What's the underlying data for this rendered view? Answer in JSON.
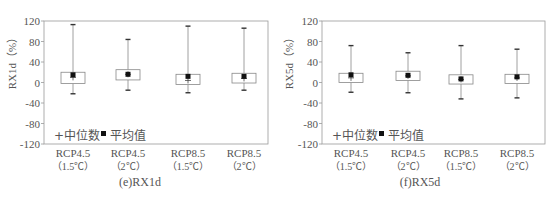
{
  "chart_data": [
    {
      "type": "box",
      "title": "(e)RX1d",
      "ylabel": "RX1d（%）",
      "xlabel": "",
      "ylim": [
        -120,
        120
      ],
      "yticks": [
        -120,
        -80,
        -40,
        0,
        40,
        80,
        120
      ],
      "grid": false,
      "legend": {
        "position": "lower-left",
        "entries": [
          "+中位数",
          "■ 平均值"
        ]
      },
      "categories": [
        [
          "RCP4.5",
          "（1.5℃）"
        ],
        [
          "RCP4.5",
          "（2℃）"
        ],
        [
          "RCP8.5",
          "（1.5℃）"
        ],
        [
          "RCP8.5",
          "（2℃）"
        ]
      ],
      "boxes": [
        {
          "whisker_high": 113,
          "q3": 20,
          "median": 10,
          "mean": 15,
          "q1": -2,
          "whisker_low": -22
        },
        {
          "whisker_high": 84,
          "q3": 25,
          "median": 16,
          "mean": 16,
          "q1": 5,
          "whisker_low": -15
        },
        {
          "whisker_high": 110,
          "q3": 16,
          "median": 4,
          "mean": 12,
          "q1": -4,
          "whisker_low": -20
        },
        {
          "whisker_high": 106,
          "q3": 18,
          "median": 8,
          "mean": 12,
          "q1": -1,
          "whisker_low": -15
        }
      ]
    },
    {
      "type": "box",
      "title": "(f)RX5d",
      "ylabel": "RX5d（%）",
      "xlabel": "",
      "ylim": [
        -120,
        120
      ],
      "yticks": [
        -120,
        -80,
        -40,
        0,
        40,
        80,
        120
      ],
      "grid": false,
      "legend": {
        "position": "lower-left",
        "entries": [
          "+中位数",
          "■ 平均值"
        ]
      },
      "categories": [
        [
          "RCP4.5",
          "（1.5℃）"
        ],
        [
          "RCP4.5",
          "（2℃）"
        ],
        [
          "RCP8.5",
          "（1.5℃）"
        ],
        [
          "RCP8.5",
          "（2℃）"
        ]
      ],
      "boxes": [
        {
          "whisker_high": 72,
          "q3": 18,
          "median": 9,
          "mean": 15,
          "q1": 0,
          "whisker_low": -19
        },
        {
          "whisker_high": 58,
          "q3": 22,
          "median": 13,
          "mean": 14,
          "q1": 4,
          "whisker_low": -20
        },
        {
          "whisker_high": 72,
          "q3": 15,
          "median": 6,
          "mean": 7,
          "q1": -3,
          "whisker_low": -32
        },
        {
          "whisker_high": 65,
          "q3": 16,
          "median": 9,
          "mean": 11,
          "q1": -2,
          "whisker_low": -30
        }
      ]
    }
  ],
  "panels": [
    {
      "caption": "(e)RX1d",
      "ylabel": "RX1d（%）",
      "legend_median": "+中位数",
      "legend_mean": "平均值"
    },
    {
      "caption": "(f)RX5d",
      "ylabel": "RX5d（%）",
      "legend_median": "+中位数",
      "legend_mean": "平均值"
    }
  ],
  "style": {
    "axis_color": "#999999",
    "box_color": "#888888",
    "mean_color": "#111111",
    "text_color": "#555555"
  }
}
